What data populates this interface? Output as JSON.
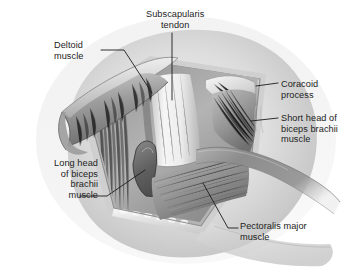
{
  "figure": {
    "kind": "anatomical-illustration",
    "style": "grayscale medical illustration",
    "background_color": "#ffffff",
    "ink_color": "#1c1c1c"
  },
  "labels": [
    {
      "id": "subscapularis-tendon",
      "text": "Subscapularis\ntendon",
      "lines": [
        "Subscapularis",
        "tendon"
      ],
      "align": "center",
      "leader": "vertical-down"
    },
    {
      "id": "deltoid-muscle",
      "text": "Deltoid\nmuscle",
      "lines": [
        "Deltoid",
        "muscle"
      ],
      "align": "left",
      "leader": "down-right"
    },
    {
      "id": "coracoid-process",
      "text": "Coracoid\nprocess",
      "lines": [
        "Coracoid",
        "process"
      ],
      "align": "left",
      "leader": "left-horizontal"
    },
    {
      "id": "short-head-biceps",
      "text": "Short head of\nbiceps brachii\nmuscle",
      "lines": [
        "Short head of",
        "biceps brachii",
        "muscle"
      ],
      "align": "left",
      "leader": "left-horizontal"
    },
    {
      "id": "long-head-biceps",
      "text": "Long head\nof biceps\nbrachii\nmuscle",
      "lines": [
        "Long head",
        "of biceps",
        "brachii",
        "muscle"
      ],
      "align": "right",
      "leader": "up-right"
    },
    {
      "id": "pectoralis-major",
      "text": "Pectoralis major\nmuscle",
      "lines": [
        "Pectoralis major",
        "muscle"
      ],
      "align": "left",
      "leader": "up-left"
    }
  ],
  "structures": [
    {
      "id": "skin-shoulder-surface",
      "tone": "#d9d9d9"
    },
    {
      "id": "wound-margin-bevel",
      "tone": "#b9b9b9"
    },
    {
      "id": "subcutaneous-fat-nodules",
      "tone": "#efefef"
    },
    {
      "id": "deltoid-flap-retracted",
      "tone": "#9a9a9a"
    },
    {
      "id": "subscapularis-tendon-strip",
      "tone": "#efefef"
    },
    {
      "id": "coracoid-process-bone",
      "tone": "#e4e4e4"
    },
    {
      "id": "short-head-biceps-belly",
      "tone": "#a8a8a8"
    },
    {
      "id": "long-head-biceps-tendon",
      "tone": "#6e6e6e"
    },
    {
      "id": "pectoralis-major-belly",
      "tone": "#9f9f9f"
    },
    {
      "id": "retractor-band",
      "tone": "#8e8e8e"
    },
    {
      "id": "small-vessels",
      "tone": "#c4c4c4"
    }
  ]
}
